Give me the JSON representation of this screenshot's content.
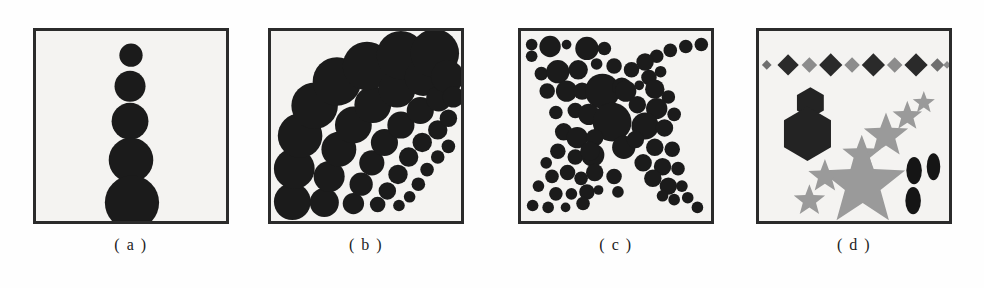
{
  "figure": {
    "background_color": "#fefefe",
    "panel_fill": "#f4f3f1",
    "panel_border_color": "#2b2b2b",
    "ink_dark": "#1b1b1b",
    "ink_gray": "#8c8c8c",
    "ink_mid_gray": "#6f6f6f",
    "panel_count": 4
  },
  "captions": {
    "a": "( a )",
    "b": "( b )",
    "c": "( c )",
    "d": "( d )"
  },
  "chart_data": [
    {
      "type": "scatter",
      "panel": "a",
      "title": "( a )",
      "description": "Vertical column of five filled circles increasing in radius from top to bottom",
      "xlabel": "",
      "ylabel": "",
      "xlim": [
        0,
        196
      ],
      "ylim": [
        0,
        196
      ],
      "grid": false,
      "legend": "none",
      "marker": "circle",
      "color": "#1b1b1b",
      "points": [
        {
          "x": 98,
          "y": 25,
          "r": 12
        },
        {
          "x": 97,
          "y": 57,
          "r": 16
        },
        {
          "x": 97,
          "y": 93,
          "r": 19
        },
        {
          "x": 98,
          "y": 133,
          "r": 23
        },
        {
          "x": 99,
          "y": 177,
          "r": 28
        }
      ]
    },
    {
      "type": "scatter",
      "panel": "b",
      "title": "( b )",
      "description": "Radial fan of circles emanating from the lower-left corner; seven arcs whose markers shrink with distance from the corner and grow with arc angle",
      "xlabel": "",
      "ylabel": "",
      "xlim": [
        0,
        196
      ],
      "ylim": [
        0,
        196
      ],
      "grid": false,
      "legend": "none",
      "marker": "circle",
      "color": "#1b1b1b",
      "points": [
        {
          "x": 22,
          "y": 176,
          "r": 19
        },
        {
          "x": 55,
          "y": 177,
          "r": 15
        },
        {
          "x": 85,
          "y": 178,
          "r": 11
        },
        {
          "x": 110,
          "y": 179,
          "r": 8
        },
        {
          "x": 132,
          "y": 180,
          "r": 6
        },
        {
          "x": 24,
          "y": 142,
          "r": 21
        },
        {
          "x": 60,
          "y": 150,
          "r": 16
        },
        {
          "x": 93,
          "y": 158,
          "r": 12
        },
        {
          "x": 120,
          "y": 165,
          "r": 9
        },
        {
          "x": 143,
          "y": 171,
          "r": 6
        },
        {
          "x": 30,
          "y": 108,
          "r": 23
        },
        {
          "x": 70,
          "y": 122,
          "r": 18
        },
        {
          "x": 104,
          "y": 136,
          "r": 13
        },
        {
          "x": 131,
          "y": 148,
          "r": 10
        },
        {
          "x": 152,
          "y": 158,
          "r": 7
        },
        {
          "x": 45,
          "y": 77,
          "r": 24
        },
        {
          "x": 85,
          "y": 97,
          "r": 19
        },
        {
          "x": 117,
          "y": 115,
          "r": 14
        },
        {
          "x": 142,
          "y": 130,
          "r": 10
        },
        {
          "x": 161,
          "y": 143,
          "r": 7
        },
        {
          "x": 68,
          "y": 52,
          "r": 25
        },
        {
          "x": 105,
          "y": 76,
          "r": 19
        },
        {
          "x": 134,
          "y": 97,
          "r": 14
        },
        {
          "x": 156,
          "y": 115,
          "r": 10
        },
        {
          "x": 172,
          "y": 130,
          "r": 7
        },
        {
          "x": 99,
          "y": 36,
          "r": 25
        },
        {
          "x": 130,
          "y": 60,
          "r": 19
        },
        {
          "x": 154,
          "y": 82,
          "r": 14
        },
        {
          "x": 172,
          "y": 102,
          "r": 10
        },
        {
          "x": 183,
          "y": 119,
          "r": 7
        },
        {
          "x": 134,
          "y": 25,
          "r": 25
        },
        {
          "x": 157,
          "y": 48,
          "r": 19
        },
        {
          "x": 173,
          "y": 70,
          "r": 13
        },
        {
          "x": 183,
          "y": 90,
          "r": 9
        },
        {
          "x": 169,
          "y": 23,
          "r": 25
        },
        {
          "x": 182,
          "y": 47,
          "r": 17
        },
        {
          "x": 188,
          "y": 68,
          "r": 11
        }
      ]
    },
    {
      "type": "scatter",
      "panel": "c",
      "title": "( c )",
      "description": "Two crossing diagonal bands of circles forming an X; marker radius grows toward the centre of the panel",
      "xlabel": "",
      "ylabel": "",
      "xlim": [
        0,
        196
      ],
      "ylim": [
        0,
        196
      ],
      "grid": false,
      "legend": "none",
      "marker": "circle",
      "color": "#1b1b1b",
      "points": [
        {
          "x": 11,
          "y": 14,
          "r": 6
        },
        {
          "x": 11,
          "y": 26,
          "r": 6
        },
        {
          "x": 30,
          "y": 16,
          "r": 11
        },
        {
          "x": 47,
          "y": 14,
          "r": 5
        },
        {
          "x": 68,
          "y": 18,
          "r": 12
        },
        {
          "x": 86,
          "y": 18,
          "r": 7
        },
        {
          "x": 96,
          "y": 36,
          "r": 8
        },
        {
          "x": 21,
          "y": 44,
          "r": 7
        },
        {
          "x": 38,
          "y": 42,
          "r": 12
        },
        {
          "x": 59,
          "y": 40,
          "r": 10
        },
        {
          "x": 78,
          "y": 34,
          "r": 6
        },
        {
          "x": 27,
          "y": 62,
          "r": 8
        },
        {
          "x": 47,
          "y": 62,
          "r": 11
        },
        {
          "x": 63,
          "y": 62,
          "r": 9
        },
        {
          "x": 84,
          "y": 62,
          "r": 18
        },
        {
          "x": 104,
          "y": 58,
          "r": 10
        },
        {
          "x": 36,
          "y": 84,
          "r": 7
        },
        {
          "x": 56,
          "y": 82,
          "r": 8
        },
        {
          "x": 70,
          "y": 86,
          "r": 11
        },
        {
          "x": 94,
          "y": 94,
          "r": 20
        },
        {
          "x": 44,
          "y": 104,
          "r": 9
        },
        {
          "x": 58,
          "y": 110,
          "r": 11
        },
        {
          "x": 76,
          "y": 110,
          "r": 9
        },
        {
          "x": 106,
          "y": 120,
          "r": 12
        },
        {
          "x": 38,
          "y": 124,
          "r": 8
        },
        {
          "x": 56,
          "y": 130,
          "r": 8
        },
        {
          "x": 74,
          "y": 128,
          "r": 12
        },
        {
          "x": 71,
          "y": 124,
          "r": 10
        },
        {
          "x": 26,
          "y": 136,
          "r": 6
        },
        {
          "x": 32,
          "y": 150,
          "r": 7
        },
        {
          "x": 48,
          "y": 146,
          "r": 8
        },
        {
          "x": 62,
          "y": 152,
          "r": 7
        },
        {
          "x": 76,
          "y": 146,
          "r": 9
        },
        {
          "x": 18,
          "y": 160,
          "r": 6
        },
        {
          "x": 36,
          "y": 168,
          "r": 7
        },
        {
          "x": 52,
          "y": 168,
          "r": 6
        },
        {
          "x": 68,
          "y": 166,
          "r": 8
        },
        {
          "x": 12,
          "y": 180,
          "r": 6
        },
        {
          "x": 28,
          "y": 182,
          "r": 6
        },
        {
          "x": 46,
          "y": 182,
          "r": 5
        },
        {
          "x": 64,
          "y": 178,
          "r": 7
        },
        {
          "x": 80,
          "y": 164,
          "r": 5
        },
        {
          "x": 186,
          "y": 14,
          "r": 7
        },
        {
          "x": 170,
          "y": 16,
          "r": 7
        },
        {
          "x": 154,
          "y": 20,
          "r": 7
        },
        {
          "x": 140,
          "y": 26,
          "r": 7
        },
        {
          "x": 128,
          "y": 32,
          "r": 9
        },
        {
          "x": 144,
          "y": 42,
          "r": 6
        },
        {
          "x": 114,
          "y": 40,
          "r": 8
        },
        {
          "x": 132,
          "y": 48,
          "r": 8
        },
        {
          "x": 122,
          "y": 56,
          "r": 5
        },
        {
          "x": 138,
          "y": 60,
          "r": 10
        },
        {
          "x": 108,
          "y": 62,
          "r": 11
        },
        {
          "x": 152,
          "y": 68,
          "r": 7
        },
        {
          "x": 120,
          "y": 76,
          "r": 9
        },
        {
          "x": 140,
          "y": 80,
          "r": 11
        },
        {
          "x": 158,
          "y": 86,
          "r": 7
        },
        {
          "x": 128,
          "y": 98,
          "r": 14
        },
        {
          "x": 148,
          "y": 100,
          "r": 9
        },
        {
          "x": 118,
          "y": 112,
          "r": 9
        },
        {
          "x": 138,
          "y": 120,
          "r": 9
        },
        {
          "x": 156,
          "y": 122,
          "r": 8
        },
        {
          "x": 126,
          "y": 136,
          "r": 9
        },
        {
          "x": 146,
          "y": 140,
          "r": 9
        },
        {
          "x": 162,
          "y": 142,
          "r": 7
        },
        {
          "x": 136,
          "y": 152,
          "r": 9
        },
        {
          "x": 152,
          "y": 160,
          "r": 9
        },
        {
          "x": 166,
          "y": 160,
          "r": 6
        },
        {
          "x": 146,
          "y": 170,
          "r": 6
        },
        {
          "x": 158,
          "y": 174,
          "r": 6
        },
        {
          "x": 172,
          "y": 172,
          "r": 6
        },
        {
          "x": 182,
          "y": 182,
          "r": 6
        },
        {
          "x": 96,
          "y": 150,
          "r": 8
        },
        {
          "x": 100,
          "y": 166,
          "r": 6
        }
      ]
    },
    {
      "type": "scatter",
      "panel": "d",
      "title": "( d )",
      "description": "Mixed glyph panel: a horizontal row of alternating dark and light diamonds across the top, two black hexagons at the left, a diagonal chain of gray stars shrinking toward the upper right, a large gray star at bottom-centre and three small black vertical ellipses at the right",
      "xlabel": "",
      "ylabel": "",
      "xlim": [
        0,
        196
      ],
      "ylim": [
        0,
        196
      ],
      "grid": false,
      "legend": "none",
      "groups": [
        {
          "name": "diamond-row",
          "marker": "diamond",
          "count": 10,
          "items": [
            {
              "x": 8,
              "y": 35,
              "r": 5,
              "color": "#6f6f6f"
            },
            {
              "x": 30,
              "y": 35,
              "r": 11,
              "color": "#2a2a2a"
            },
            {
              "x": 52,
              "y": 35,
              "r": 8,
              "color": "#8c8c8c"
            },
            {
              "x": 74,
              "y": 35,
              "r": 12,
              "color": "#2a2a2a"
            },
            {
              "x": 96,
              "y": 35,
              "r": 8,
              "color": "#8c8c8c"
            },
            {
              "x": 118,
              "y": 35,
              "r": 12,
              "color": "#2a2a2a"
            },
            {
              "x": 140,
              "y": 35,
              "r": 8,
              "color": "#8c8c8c"
            },
            {
              "x": 162,
              "y": 35,
              "r": 12,
              "color": "#2a2a2a"
            },
            {
              "x": 184,
              "y": 35,
              "r": 7,
              "color": "#6f6f6f"
            },
            {
              "x": 194,
              "y": 35,
              "r": 4,
              "color": "#8c8c8c"
            }
          ]
        },
        {
          "name": "hexagons",
          "marker": "hexagon",
          "count": 2,
          "items": [
            {
              "x": 53,
              "y": 74,
              "r": 16,
              "color": "#232323"
            },
            {
              "x": 50,
              "y": 106,
              "r": 28,
              "color": "#232323"
            }
          ]
        },
        {
          "name": "star-chain",
          "marker": "star",
          "count": 4,
          "items": [
            {
              "x": 106,
              "y": 128,
              "r": 21,
              "color": "#9a9a9a"
            },
            {
              "x": 131,
              "y": 108,
              "r": 24,
              "color": "#9a9a9a"
            },
            {
              "x": 153,
              "y": 88,
              "r": 16,
              "color": "#9a9a9a"
            },
            {
              "x": 170,
              "y": 74,
              "r": 12,
              "color": "#9a9a9a"
            }
          ]
        },
        {
          "name": "large-stars",
          "marker": "star",
          "count": 3,
          "items": [
            {
              "x": 107,
              "y": 158,
              "r": 46,
              "color": "#9a9a9a"
            },
            {
              "x": 68,
              "y": 150,
              "r": 18,
              "color": "#9a9a9a"
            },
            {
              "x": 52,
              "y": 175,
              "r": 17,
              "color": "#9a9a9a"
            }
          ]
        },
        {
          "name": "ellipses",
          "marker": "ellipse",
          "count": 3,
          "items": [
            {
              "x": 160,
              "y": 144,
              "rx": 8,
              "ry": 14,
              "color": "#151515"
            },
            {
              "x": 180,
              "y": 140,
              "rx": 7,
              "ry": 14,
              "color": "#151515"
            },
            {
              "x": 159,
              "y": 175,
              "rx": 8,
              "ry": 14,
              "color": "#151515"
            }
          ]
        }
      ]
    }
  ]
}
